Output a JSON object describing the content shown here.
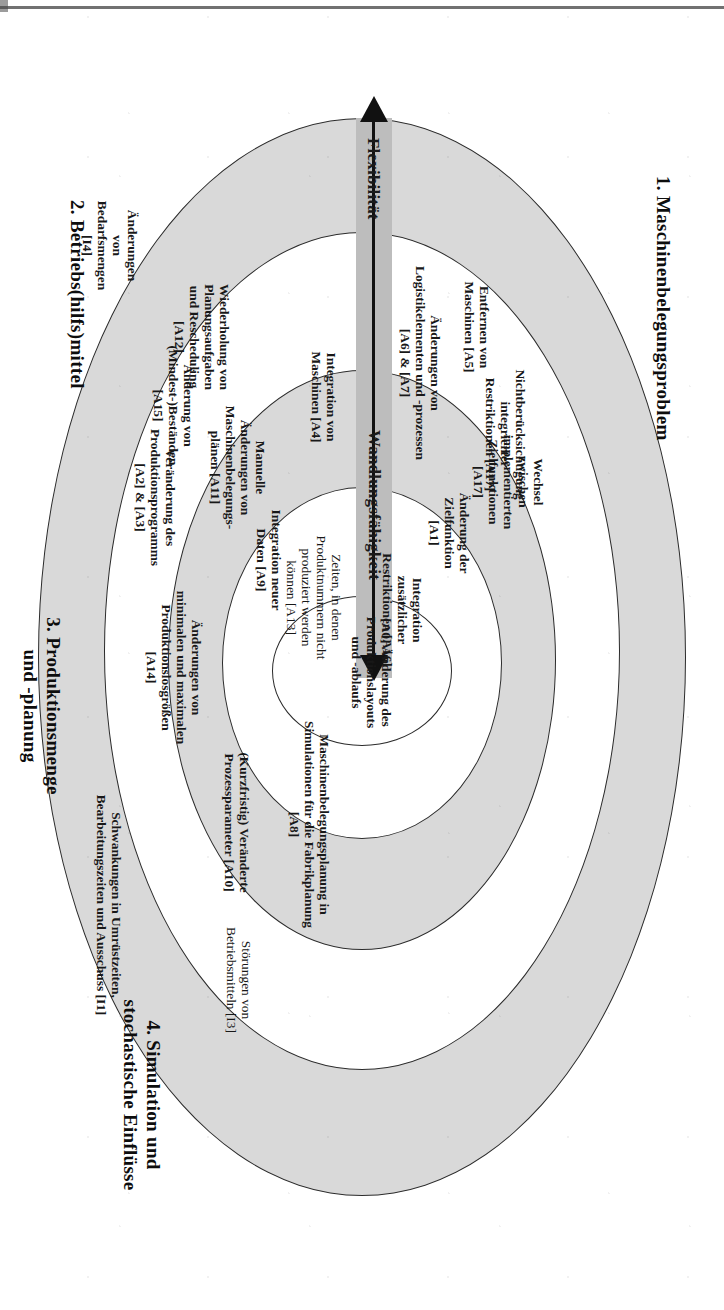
{
  "diagram": {
    "type": "concentric-onion",
    "orientation": "rotated-90-clockwise",
    "arrow": {
      "left_label": "Flexibilität",
      "right_label": "Wandlungsfähigkeit",
      "double_headed": true,
      "band_color": "#bdbdbd"
    },
    "colors": {
      "shaded_ring": "#d9d9d9",
      "white_ring": "#ffffff",
      "outline": "#2b2b2b",
      "text": "#181818"
    },
    "captions": [
      {
        "id": "cap1",
        "text": "1. Maschinenbelegungsproblem"
      },
      {
        "id": "cap2",
        "text": "2. Betriebs(hilfs)mittel"
      },
      {
        "id": "cap3",
        "line1": "3. Produktionsmenge",
        "line2": "und -planung"
      },
      {
        "id": "cap4",
        "line1": "4. Simulation und",
        "line2": "stochastische Einflüsse"
      }
    ],
    "center": {
      "id": "A0",
      "lines": [
        "[A0] Änderung des",
        "Produktionslayouts",
        "und -ablaufs"
      ]
    },
    "items": [
      {
        "id": "A17a",
        "lines": [
          "Nichtberücksichtigung",
          "integrierter",
          "Restriktionen [A17]"
        ]
      },
      {
        "id": "A17b",
        "lines": [
          "Wechsel",
          "zwischen",
          "implementierten",
          "Zielfunktionen",
          "[A17]"
        ]
      },
      {
        "id": "A13",
        "lines": [
          "Zeiten, in denen",
          "Produktnummern nicht",
          "produziert werden",
          "können [A13]"
        ]
      },
      {
        "id": "A16",
        "lines": [
          "Integration",
          "zusätzlicher",
          "Restriktionen [A16]"
        ]
      },
      {
        "id": "A1",
        "lines": [
          "Änderung der",
          "Zielfunktion",
          "[A1]"
        ]
      },
      {
        "id": "A5",
        "lines": [
          "Entfernen von",
          "Maschinen [A5]"
        ]
      },
      {
        "id": "A6A7",
        "lines": [
          "Änderungen von",
          "Logistikelementen und -prozessen",
          "[A6] & [A7]"
        ]
      },
      {
        "id": "A4",
        "lines": [
          "Integration von",
          "Maschinen [A4]"
        ]
      },
      {
        "id": "A9",
        "lines": [
          "Integration neuer",
          "Daten [A9]"
        ]
      },
      {
        "id": "A11",
        "lines": [
          "Manuelle",
          "Änderungen von",
          "Maschinenbelegungs-",
          "plänen [A11]"
        ]
      },
      {
        "id": "A12",
        "lines": [
          "Wiederholung von",
          "Planungsaufgaben",
          "und Rescheduling",
          "[A12]"
        ]
      },
      {
        "id": "A15",
        "lines": [
          "Änderung von",
          "(Mindest-)Beständen",
          "[A15]"
        ]
      },
      {
        "id": "A2A3",
        "lines": [
          "Veränderung des",
          "Produktionsprogramms",
          "[A2] & [A3]"
        ]
      },
      {
        "id": "A14",
        "lines": [
          "Änderungen von",
          "minimalen und maximalen",
          "Produktionslosgrößen",
          "[A14]"
        ]
      },
      {
        "id": "I4",
        "lines": [
          "Änderungen",
          "von",
          "Bedarfsmengen",
          "[I4]"
        ]
      },
      {
        "id": "A8",
        "lines": [
          "Maschinenbelegungsplanung in",
          "Simulationen für die Fabrikplanung",
          "[A8]"
        ]
      },
      {
        "id": "A10",
        "lines": [
          "(Kurzfristig) Veränderte",
          "Prozessparameter [A10]"
        ]
      },
      {
        "id": "I1",
        "lines": [
          "Schwankungen in Umrüstzeiten,",
          "Bearbeitungszeiten und Ausschuss [I1]"
        ]
      },
      {
        "id": "I3",
        "lines": [
          "Störungen von",
          "Betriebsmitteln [I3]"
        ]
      }
    ]
  }
}
